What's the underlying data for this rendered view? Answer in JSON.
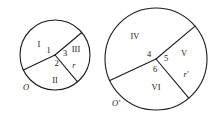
{
  "figure": {
    "stroke_color": "#1a1a1a",
    "background_color": "#ffffff",
    "circles": [
      {
        "name": "left-circle",
        "center_label": "O",
        "radius_label": "r",
        "cx": 55,
        "cy": 55,
        "r": 35,
        "sector_labels": [
          "I",
          "II",
          "III"
        ],
        "angle_labels": [
          "1",
          "2",
          "3"
        ],
        "radius_angles_deg": [
          -40,
          105,
          205
        ]
      },
      {
        "name": "right-circle",
        "center_label": "O'",
        "radius_label": "r'",
        "cx": 156,
        "cy": 59,
        "r": 51,
        "sector_labels": [
          "IV",
          "V",
          "VI"
        ],
        "angle_labels": [
          "4",
          "5",
          "6"
        ],
        "radius_angles_deg": [
          -40,
          105,
          205
        ]
      }
    ],
    "labels": {
      "left": {
        "center": "O",
        "radius": "r",
        "sector_1": "I",
        "sector_2": "II",
        "sector_3": "III",
        "angle_1": "1",
        "angle_2": "2",
        "angle_3": "3"
      },
      "right": {
        "center": "O'",
        "radius": "r'",
        "sector_1": "IV",
        "sector_2": "V",
        "sector_3": "VI",
        "angle_1": "4",
        "angle_2": "5",
        "angle_3": "6"
      }
    }
  }
}
